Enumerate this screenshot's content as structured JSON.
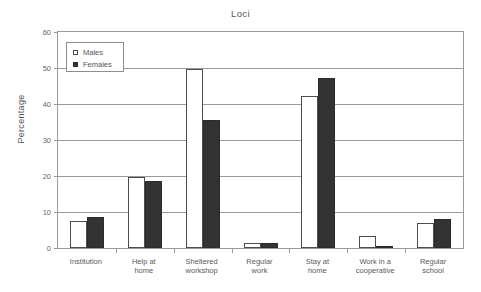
{
  "chart_data": {
    "type": "bar",
    "title": "Loci",
    "xlabel": "",
    "ylabel": "Percentage",
    "ylim": [
      0,
      60
    ],
    "ytick_values": [
      0,
      10,
      20,
      30,
      40,
      50,
      60
    ],
    "ytick_labels": [
      "0",
      "10",
      "20",
      "30",
      "40",
      "50",
      "60"
    ],
    "grid": true,
    "legend_position": "upper-left-inside",
    "categories": [
      "Institution",
      "Help at\nhome",
      "Sheltered\nworkshop",
      "Regular\nwork",
      "Stay at\nhome",
      "Work in a\ncooperative",
      "Regular\nschool"
    ],
    "series": [
      {
        "name": "Males",
        "color": "#ffffff",
        "edge_color": "#4d4d4d",
        "values": [
          7.5,
          19.7,
          49.8,
          1.3,
          42.2,
          3.3,
          7.0
        ]
      },
      {
        "name": "Females",
        "color": "#333333",
        "edge_color": "#2b2b2b",
        "values": [
          8.6,
          18.5,
          35.5,
          1.3,
          47.3,
          0.4,
          8.0
        ]
      }
    ]
  },
  "legend": {
    "entries": [
      {
        "label": "Males",
        "swatch": "hollow-square-icon"
      },
      {
        "label": "Females",
        "swatch": "filled-square-icon"
      }
    ]
  }
}
